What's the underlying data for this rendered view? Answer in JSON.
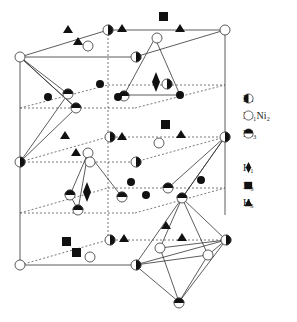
{
  "figure": {
    "colors": {
      "line": "#333333",
      "fill": "#111111",
      "background": "#ffffff"
    }
  },
  "legend": {
    "items": [
      {
        "symbol": "half-filled-circle-left",
        "label": "La"
      },
      {
        "symbol": "open-circle",
        "label": "Ni₁Ni₂"
      },
      {
        "symbol": "half-filled-circle-top",
        "label": "Ni₃"
      },
      {
        "symbol": "diamond",
        "label": "H₁"
      },
      {
        "symbol": "square",
        "label": "H₃"
      },
      {
        "symbol": "triangle",
        "label": "H₅"
      }
    ]
  }
}
